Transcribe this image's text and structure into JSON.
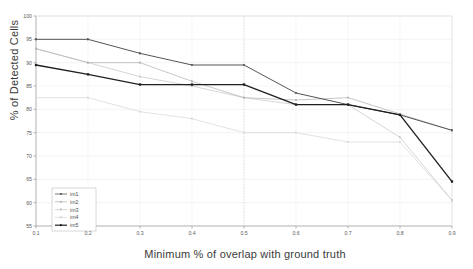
{
  "chart_data": {
    "type": "line",
    "title": "",
    "xlabel": "Minimum % of overlap with ground truth",
    "ylabel": "% of Detected Cells",
    "x": [
      0.1,
      0.2,
      0.3,
      0.4,
      0.5,
      0.6,
      0.7,
      0.8,
      0.9
    ],
    "xticklabels": [
      "0.1",
      "0.2",
      "0.3",
      "0.4",
      "0.5",
      "0.6",
      "0.7",
      "0.8",
      "0.9"
    ],
    "yticklabels": [
      "55",
      "60",
      "65",
      "70",
      "75",
      "80",
      "85",
      "90",
      "95",
      "100"
    ],
    "xlim": [
      0.1,
      0.9
    ],
    "ylim": [
      55,
      100
    ],
    "ytick_step": 5,
    "grid": true,
    "legend_position": "lower-left",
    "series": [
      {
        "name": "im1",
        "color": "#555555",
        "marker": "square",
        "values": [
          95.0,
          95.0,
          92.0,
          89.5,
          89.5,
          83.5,
          81.0,
          78.8,
          75.5
        ]
      },
      {
        "name": "im2",
        "color": "#b4b4b4",
        "marker": "square",
        "values": [
          93.0,
          90.0,
          90.0,
          86.0,
          82.5,
          82.0,
          82.5,
          79.0,
          75.5
        ]
      },
      {
        "name": "im3",
        "color": "#c8c8c8",
        "marker": "square",
        "values": [
          93.0,
          90.0,
          87.0,
          85.0,
          82.5,
          81.0,
          81.0,
          74.0,
          60.5
        ]
      },
      {
        "name": "im4",
        "color": "#d8d8d8",
        "marker": "square",
        "values": [
          82.5,
          82.5,
          79.5,
          78.0,
          75.0,
          75.0,
          73.0,
          73.0,
          60.5
        ]
      },
      {
        "name": "im5",
        "color": "#202020",
        "marker": "square",
        "values": [
          89.5,
          87.5,
          85.3,
          85.3,
          85.3,
          81.0,
          81.0,
          78.8,
          64.5
        ]
      }
    ]
  },
  "legend": {
    "entries": [
      "im1",
      "im2",
      "im3",
      "im4",
      "im5"
    ]
  },
  "axes": {
    "x_title": "Minimum % of overlap with ground truth",
    "y_title": "% of Detected Cells"
  }
}
